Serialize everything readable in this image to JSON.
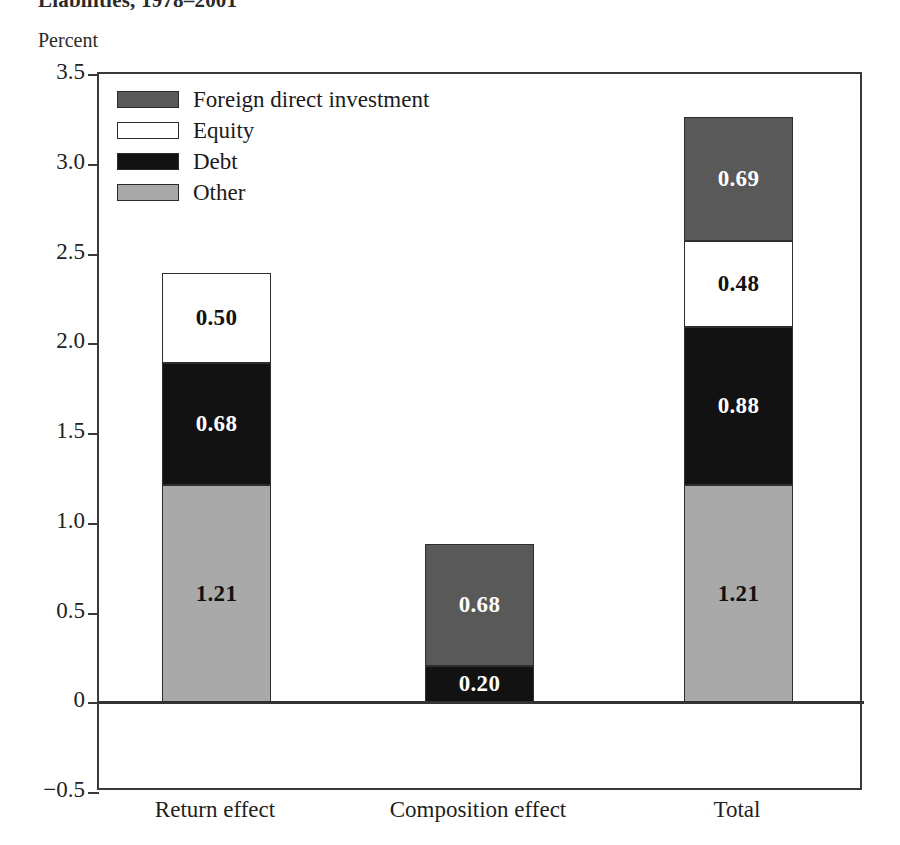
{
  "figure": {
    "title": "Liabilities, 1978–2001",
    "unit_label": "Percent"
  },
  "legend": {
    "position": "top-left-inside",
    "items": [
      {
        "label": "Foreign direct investment",
        "key": "fdi",
        "color": "#595959"
      },
      {
        "label": "Equity",
        "key": "equity",
        "color": "#ffffff"
      },
      {
        "label": "Debt",
        "key": "debt",
        "color": "#121212"
      },
      {
        "label": "Other",
        "key": "other",
        "color": "#a9a9a9"
      }
    ]
  },
  "axes": {
    "y_ticks": [
      "3.5",
      "3.0",
      "2.5",
      "2.0",
      "1.5",
      "1.0",
      "0.5",
      "0",
      "−0.5"
    ],
    "y_tick_values": [
      3.5,
      3.0,
      2.5,
      2.0,
      1.5,
      1.0,
      0.5,
      0,
      -0.5
    ],
    "y_min": -0.5,
    "y_max": 3.5,
    "x_categories": [
      "Return effect",
      "Composition effect",
      "Total"
    ]
  },
  "chart_data": {
    "type": "bar",
    "title": "Liabilities, 1978–2001",
    "xlabel": "",
    "ylabel": "Percent",
    "ylim": [
      -0.5,
      3.5
    ],
    "grid": false,
    "stacked": true,
    "legend_position": "top-left-inside",
    "categories": [
      "Return effect",
      "Composition effect",
      "Total"
    ],
    "series": [
      {
        "name": "Other",
        "color": "#a9a9a9",
        "values": [
          1.21,
          0,
          1.21
        ]
      },
      {
        "name": "Debt",
        "color": "#121212",
        "values": [
          0.68,
          0.2,
          0.88
        ]
      },
      {
        "name": "Equity",
        "color": "#ffffff",
        "values": [
          0.5,
          0,
          0.48
        ]
      },
      {
        "name": "Foreign direct investment",
        "color": "#595959",
        "values": [
          0,
          0.68,
          0.69
        ]
      }
    ],
    "totals": [
      2.39,
      0.88,
      3.26
    ],
    "annotations": [
      {
        "category": "Return effect",
        "series": "Other",
        "label": "1.21"
      },
      {
        "category": "Return effect",
        "series": "Debt",
        "label": "0.68"
      },
      {
        "category": "Return effect",
        "series": "Equity",
        "label": "0.50"
      },
      {
        "category": "Composition effect",
        "series": "Debt",
        "label": "0.20"
      },
      {
        "category": "Composition effect",
        "series": "Foreign direct investment",
        "label": "0.68"
      },
      {
        "category": "Total",
        "series": "Other",
        "label": "1.21"
      },
      {
        "category": "Total",
        "series": "Debt",
        "label": "0.88"
      },
      {
        "category": "Total",
        "series": "Equity",
        "label": "0.48"
      },
      {
        "category": "Total",
        "series": "Foreign direct investment",
        "label": "0.69"
      }
    ]
  },
  "bar_labels": {
    "return_other": "1.21",
    "return_debt": "0.68",
    "return_equity": "0.50",
    "comp_debt": "0.20",
    "comp_fdi": "0.68",
    "total_other": "1.21",
    "total_debt": "0.88",
    "total_equity": "0.48",
    "total_fdi": "0.69"
  }
}
